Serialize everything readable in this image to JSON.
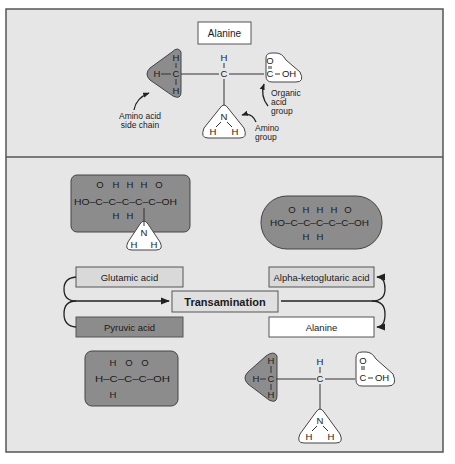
{
  "colors": {
    "panel_bg": "#e6e6e6",
    "frame": "#555555",
    "dark_shape": "#8c8c8c",
    "light_box": "#d9d9d9",
    "white_box": "#ffffff"
  },
  "top_panel": {
    "title": "Alanine",
    "molecule": {
      "side_chain_atoms": [
        "H",
        "H",
        "C",
        "H"
      ],
      "alpha_atoms": [
        "H",
        "C"
      ],
      "acid_atoms": [
        "O",
        "C",
        "OH"
      ],
      "amino_atoms": [
        "N",
        "H",
        "H"
      ]
    },
    "labels": {
      "side_chain": [
        "Amino acid",
        "side chain"
      ],
      "acid_group": [
        "Organic",
        "acid",
        "group"
      ],
      "amino_group": [
        "Amino",
        "group"
      ]
    }
  },
  "bottom_panel": {
    "glutamic_structure": {
      "top_row": [
        "O",
        "H",
        "H",
        "H",
        "O"
      ],
      "main_row": "HO–C–C–C–C–C–OH",
      "bottom_row": [
        "H",
        "H"
      ],
      "amino": [
        "N",
        "H",
        "H"
      ]
    },
    "ketoglutaric_structure": {
      "top_row": [
        "O",
        "H",
        "H",
        "H",
        "O"
      ],
      "main_row": "HO–C–C–C–C–C–OH",
      "bottom_row": [
        "H",
        "H"
      ]
    },
    "pyruvic_structure": {
      "top_row": [
        "H",
        "O",
        "O"
      ],
      "main_row": "H–C–C–C–OH",
      "bottom_row": [
        "H"
      ]
    },
    "alanine_structure": {
      "side_chain_atoms": [
        "H",
        "H",
        "C",
        "H"
      ],
      "alpha_atoms": [
        "H",
        "C"
      ],
      "acid_atoms": [
        "O",
        "C",
        "OH"
      ],
      "amino_atoms": [
        "N",
        "H",
        "H"
      ]
    },
    "reaction": {
      "center": "Transamination",
      "inputs": [
        "Glutamic acid",
        "Pyruvic acid"
      ],
      "outputs": [
        "Alpha-ketoglutaric acid",
        "Alanine"
      ]
    }
  }
}
